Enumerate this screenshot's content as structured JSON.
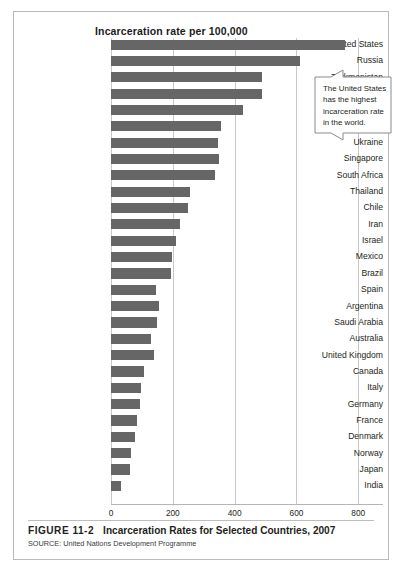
{
  "figure": {
    "number_label": "FIGURE 11-2",
    "title": "Incarceration Rates for Selected Countries, 2007",
    "source": "SOURCE: United Nations Development Programme"
  },
  "callout": {
    "text": "The United States has the highest incarceration rate in the world."
  },
  "colors": {
    "bar": "#666666",
    "gridline": "#c8c8c8",
    "frame": "#b9b9b9",
    "text": "#231f20"
  },
  "chart_data": {
    "type": "bar",
    "orientation": "horizontal",
    "title": "Incarceration rate per 100,000",
    "xlabel": "",
    "ylabel": "",
    "xlim": [
      0,
      880
    ],
    "xticks": [
      0,
      200,
      400,
      600,
      800
    ],
    "xtick_labels": [
      "0",
      "200",
      "400",
      "600",
      "800"
    ],
    "grid": "vertical",
    "legend": "none",
    "categories": [
      "United States",
      "Russia",
      "Turkmenistan",
      "Cuba",
      "Belarus",
      "Suriname",
      "Ukraine",
      "Singapore",
      "South Africa",
      "Thailand",
      "Chile",
      "Iran",
      "Israel",
      "Mexico",
      "Brazil",
      "Spain",
      "Argentina",
      "Saudi Arabia",
      "Australia",
      "United Kingdom",
      "Canada",
      "Italy",
      "Germany",
      "France",
      "Denmark",
      "Norway",
      "Japan",
      "India"
    ],
    "values": [
      756,
      611,
      489,
      487,
      426,
      356,
      345,
      350,
      335,
      256,
      249,
      222,
      209,
      198,
      193,
      145,
      154,
      150,
      129,
      139,
      107,
      97,
      93,
      85,
      77,
      66,
      63,
      33
    ],
    "units": "per 100,000"
  }
}
